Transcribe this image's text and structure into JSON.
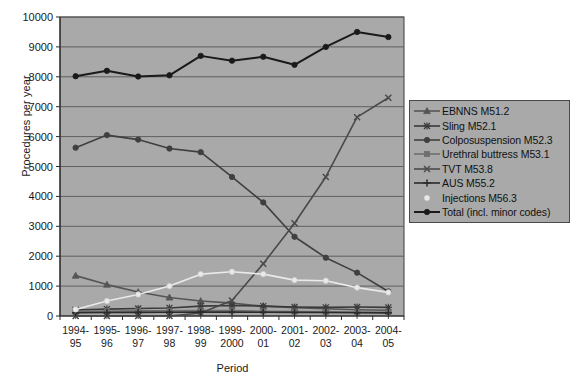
{
  "chart_data": {
    "type": "line",
    "title": "",
    "xlabel": "Period",
    "ylabel": "Procedures per year",
    "ylim": [
      0,
      10000
    ],
    "ytick_step": 1000,
    "yticks": [
      "0",
      "1000",
      "2000",
      "3000",
      "4000",
      "5000",
      "6000",
      "7000",
      "8000",
      "9000",
      "10000"
    ],
    "grid": true,
    "grid_axis": "y",
    "legend_position": "right",
    "plot_background": "#a9a9a9",
    "figure_background": "#ffffff",
    "categories": [
      "1994-95",
      "1995-96",
      "1996-97",
      "1997-98",
      "1998-99",
      "1999-2000",
      "2000-01",
      "2001-02",
      "2002-03",
      "2003-04",
      "2004-05"
    ],
    "category_lines": [
      [
        "1994-",
        "95"
      ],
      [
        "1995-",
        "96"
      ],
      [
        "1996-",
        "97"
      ],
      [
        "1997-",
        "98"
      ],
      [
        "1998-",
        "99"
      ],
      [
        "1999-",
        "2000"
      ],
      [
        "2000-",
        "01"
      ],
      [
        "2001-",
        "02"
      ],
      [
        "2002-",
        "03"
      ],
      [
        "2003-",
        "04"
      ],
      [
        "2004-",
        "05"
      ]
    ],
    "series": [
      {
        "name": "EBNNS M51.2",
        "marker": "triangle",
        "color": "#555555",
        "values": [
          1350,
          1050,
          800,
          620,
          500,
          430,
          330,
          280,
          240,
          210,
          190
        ]
      },
      {
        "name": "Sling M52.1",
        "marker": "asterisk",
        "color": "#3a3a3a",
        "values": [
          200,
          230,
          250,
          270,
          330,
          350,
          330,
          300,
          290,
          300,
          290
        ]
      },
      {
        "name": "Colposuspension M52.3",
        "marker": "circle",
        "color": "#3f3f3f",
        "values": [
          5630,
          6050,
          5900,
          5600,
          5480,
          4650,
          3800,
          2650,
          1950,
          1450,
          820
        ]
      },
      {
        "name": "Urethral buttress M53.1",
        "marker": "square",
        "color": "#6e6e6e",
        "values": [
          150,
          160,
          170,
          175,
          180,
          180,
          160,
          150,
          140,
          130,
          120
        ]
      },
      {
        "name": "TVT M53.8",
        "marker": "x",
        "color": "#4a4a4a",
        "values": [
          0,
          0,
          0,
          0,
          100,
          520,
          1750,
          3100,
          4650,
          6650,
          7300
        ]
      },
      {
        "name": "AUS M55.2",
        "marker": "plus",
        "color": "#2b2b2b",
        "values": [
          110,
          115,
          120,
          125,
          130,
          130,
          125,
          120,
          115,
          110,
          105
        ]
      },
      {
        "name": "Injections M56.3",
        "marker": "circle-light",
        "color": "#eaeaea",
        "values": [
          220,
          500,
          720,
          1000,
          1400,
          1480,
          1400,
          1200,
          1180,
          950,
          790
        ]
      },
      {
        "name": "Total (incl. minor codes)",
        "marker": "circle",
        "color": "#1a1a1a",
        "values": [
          8020,
          8200,
          8010,
          8050,
          8700,
          8540,
          8670,
          8400,
          9000,
          9500,
          9330
        ]
      }
    ]
  }
}
